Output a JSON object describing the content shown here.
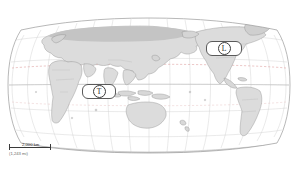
{
  "map": {
    "projection": "winkel-tripel",
    "title": "",
    "ocean_color": "#ffffff",
    "land_color": "#dcdcdc",
    "land_shade_color": "#c2c2c2",
    "coastline_color": "#8a8a8a",
    "border_color": "#a8a8a8",
    "graticule_color": "#c9c9c9",
    "frame_color": "#9a9a9a",
    "tropic_line_color": "#e0a8a8",
    "center_longitude": 110
  },
  "callouts": [
    {
      "id": "north-america",
      "marker_letter": "L",
      "label": ""
    },
    {
      "id": "indian-ocean",
      "marker_letter": "T",
      "label": ""
    }
  ],
  "scale": {
    "length_label": "2,000 km",
    "alt_label": "(1,243 mi)",
    "bar_color": "#3a3a3a"
  }
}
